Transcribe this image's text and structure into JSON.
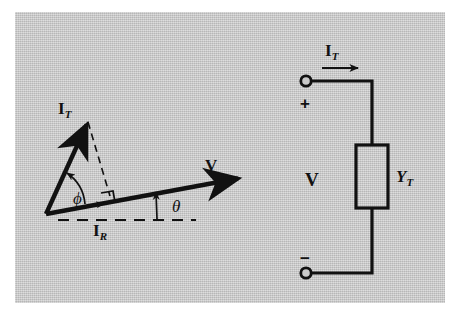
{
  "figure": {
    "background_color": "#ffffff",
    "panel_color": "#c9c9c9",
    "ink_color": "#111111",
    "width": 460,
    "height": 319
  },
  "phasor_diagram": {
    "name": "phasor-diagram",
    "vectors": [
      {
        "id": "it",
        "label_main": "I",
        "label_sub": "T",
        "label_text": "I_T",
        "style": "solid-bold-arrow",
        "from": [
          46,
          214
        ],
        "to": [
          89,
          120
        ]
      },
      {
        "id": "v",
        "label_main": "V",
        "label_sub": "",
        "label_text": "V",
        "style": "solid-bold-arrow",
        "from": [
          46,
          214
        ],
        "to": [
          245,
          177
        ]
      },
      {
        "id": "ir",
        "label_main": "I",
        "label_sub": "R",
        "label_text": "I_R",
        "style": "arrowhead-on-v-axis",
        "from": [
          46,
          214
        ],
        "to": [
          110,
          202
        ]
      }
    ],
    "angles": [
      {
        "id": "phi",
        "symbol": "ϕ",
        "between": "I_T and I_R",
        "position": [
          72,
          178
        ]
      },
      {
        "id": "theta",
        "symbol": "θ",
        "between": "V and horizontal reference",
        "position": [
          178,
          200
        ]
      }
    ],
    "markers": [
      {
        "id": "right-angle",
        "symbol": "∟",
        "note": "perpendicular projection of I_T onto V"
      }
    ],
    "construction_lines": [
      {
        "id": "projection",
        "style": "dashed",
        "from": [
          89,
          120
        ],
        "to": [
          110,
          196
        ]
      },
      {
        "id": "horizontal-reference",
        "style": "dashed",
        "from": [
          58,
          220
        ],
        "to": [
          196,
          220
        ]
      }
    ]
  },
  "circuit_diagram": {
    "name": "circuit-diagram",
    "current_label": {
      "main": "I",
      "sub": "T",
      "text": "I_T"
    },
    "current_arrow_direction": "right",
    "voltage_label": "V",
    "element_label": {
      "main": "Y",
      "sub": "T",
      "text": "Y_T"
    },
    "element_type": "admittance-box",
    "terminals": [
      {
        "id": "positive",
        "sign": "+",
        "position": [
          306,
          81
        ]
      },
      {
        "id": "negative",
        "sign": "−",
        "position": [
          306,
          273
        ]
      }
    ]
  }
}
